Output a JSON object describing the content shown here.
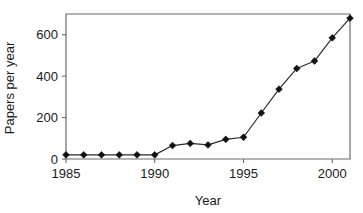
{
  "chart_data": {
    "type": "line",
    "title": "",
    "xlabel": "Year",
    "ylabel": "Papers per year",
    "x": [
      1985,
      1986,
      1987,
      1988,
      1989,
      1990,
      1991,
      1992,
      1993,
      1994,
      1995,
      1996,
      1997,
      1998,
      1999,
      2000,
      2001
    ],
    "values": [
      20,
      20,
      20,
      20,
      20,
      20,
      65,
      75,
      68,
      95,
      105,
      222,
      337,
      437,
      473,
      585,
      680
    ],
    "series": [
      {
        "name": "Papers per year",
        "values": [
          20,
          20,
          20,
          20,
          20,
          20,
          65,
          75,
          68,
          95,
          105,
          222,
          337,
          437,
          473,
          585,
          680
        ]
      }
    ],
    "xlim": [
      1985,
      2001
    ],
    "ylim": [
      0,
      700
    ],
    "xticks": [
      1985,
      1990,
      1995,
      2000
    ],
    "xtick_labels": [
      "1985",
      "1990",
      "1995",
      "2000"
    ],
    "yticks": [
      0,
      200,
      400,
      600
    ],
    "ytick_labels": [
      "0",
      "200",
      "400",
      "600"
    ],
    "grid": false,
    "legend": false,
    "marker": "diamond",
    "line_color": "#2b2b2b",
    "marker_color": "#111111",
    "frame_color": "#6b6b6b",
    "background": "#ffffff"
  }
}
